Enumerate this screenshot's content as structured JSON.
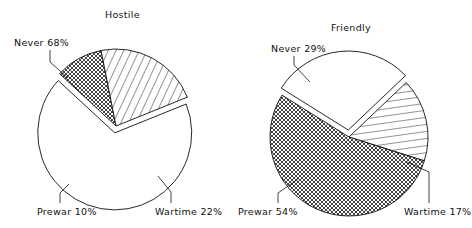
{
  "chart_data": [
    {
      "type": "pie",
      "title": "Hostile",
      "categories": [
        "Never",
        "Prewar",
        "Wartime"
      ],
      "values": [
        68,
        10,
        22
      ],
      "labels": [
        "Never 68%",
        "Prewar 10%",
        "Wartime 22%"
      ],
      "patterns": [
        "blank",
        "crosshatch",
        "diagonal-lines"
      ],
      "exploded": [
        "Never"
      ]
    },
    {
      "type": "pie",
      "title": "Friendly",
      "categories": [
        "Never",
        "Prewar",
        "Wartime"
      ],
      "values": [
        29,
        54,
        17
      ],
      "labels": [
        "Never 29%",
        "Prewar 54%",
        "Wartime 17%"
      ],
      "patterns": [
        "blank",
        "crosshatch",
        "horizontal-lines"
      ],
      "exploded": [
        "Never"
      ]
    }
  ],
  "colors": {
    "stroke": "#111111",
    "background": "#ffffff"
  }
}
